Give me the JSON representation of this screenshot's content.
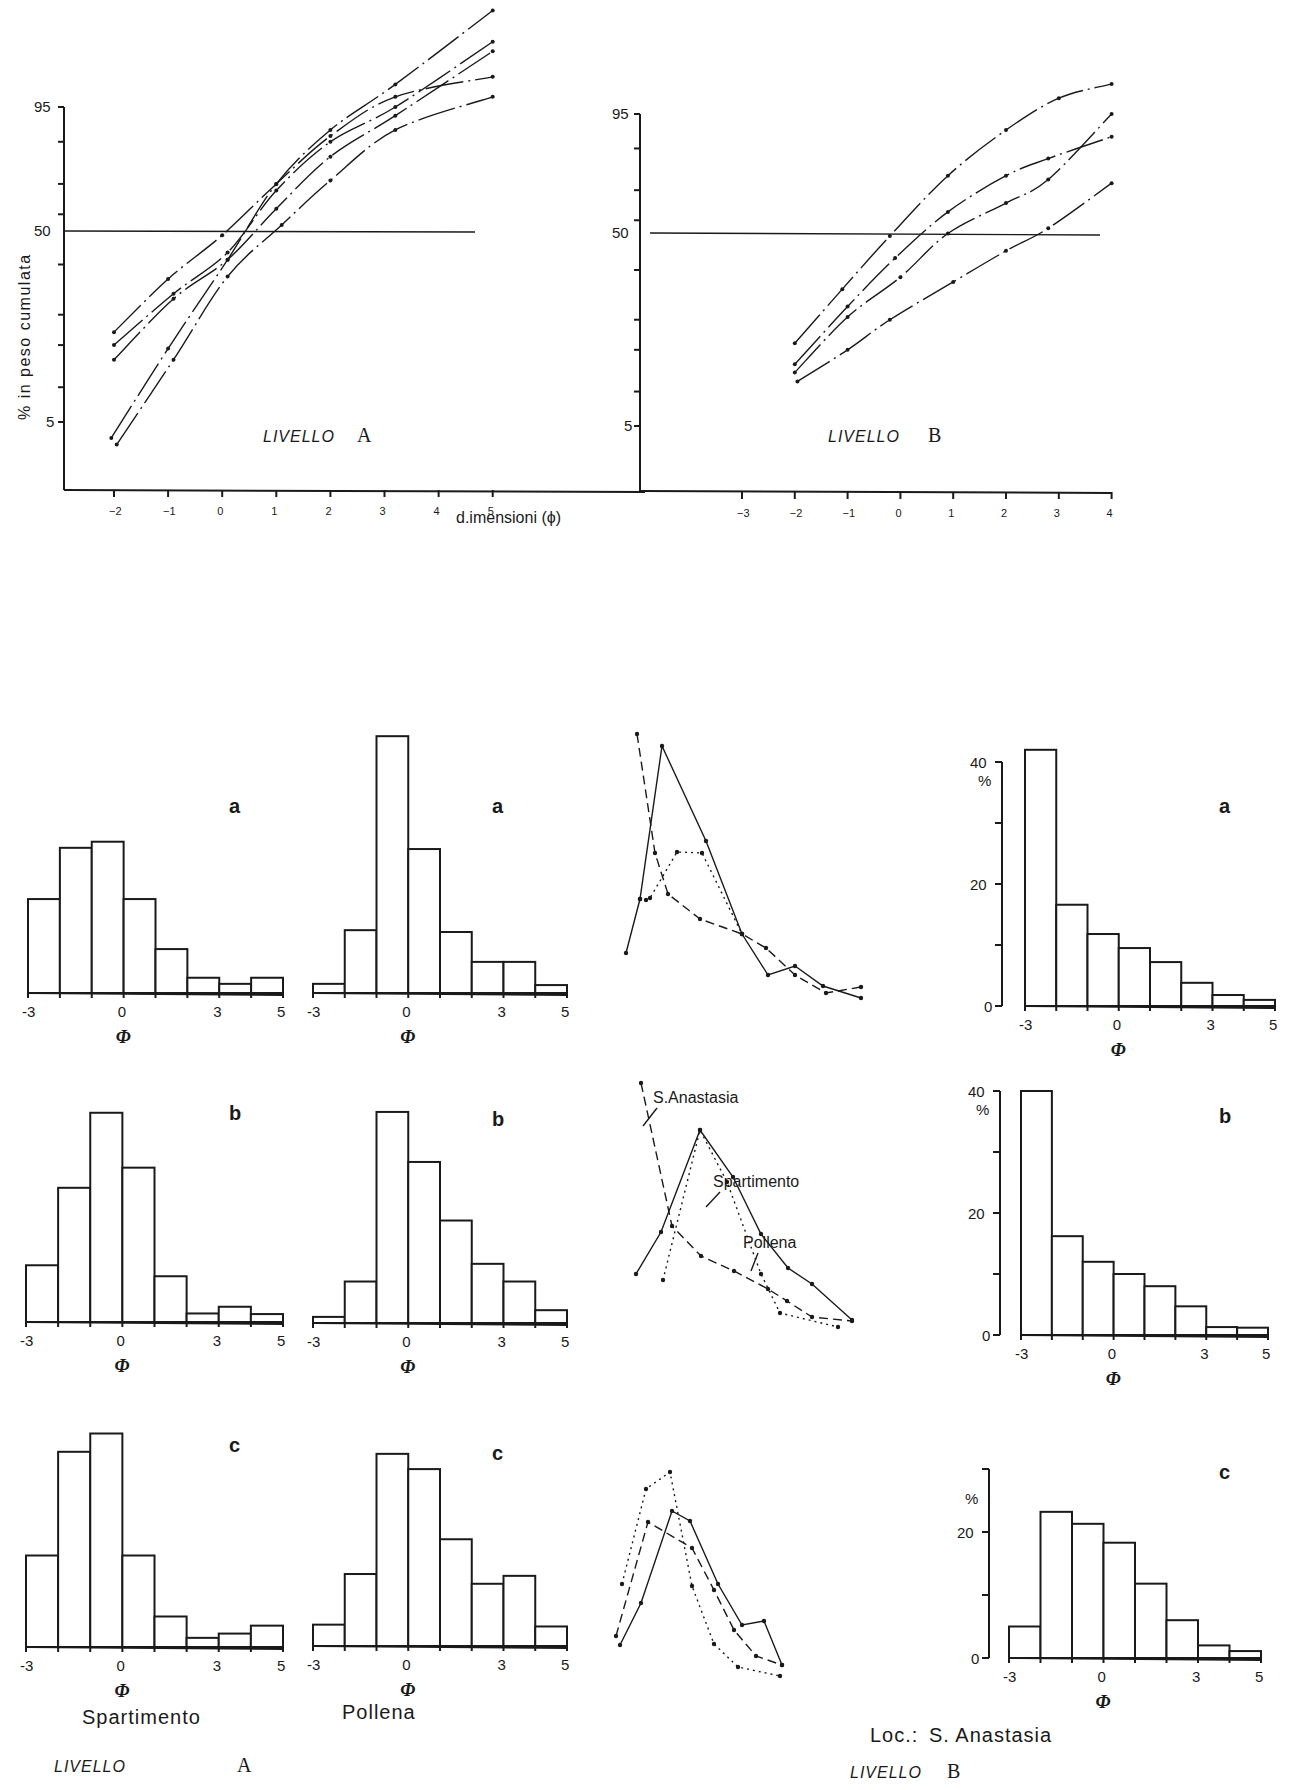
{
  "figure": {
    "y_axis_label": "% in peso cumulata",
    "x_axis_label": "d.imensioni (ϕ)",
    "phi_symbol": "Φ",
    "percent_symbol": "%",
    "livello_word": "LIVELLO",
    "level_a": "A",
    "level_b": "B",
    "location_prefix": "Loc.:",
    "location_name": "S. Anastasia",
    "col_labels": [
      "Spartimento",
      "Pollena"
    ],
    "annotations": [
      "S.Anastasia",
      "Spartimento",
      "Pollena"
    ],
    "panel_letters": [
      "a",
      "b",
      "c"
    ]
  },
  "chart_data": [
    {
      "id": "cumulative-livello-A",
      "type": "line",
      "title": "LIVELLO A",
      "xlabel": "dimensioni (ϕ)",
      "ylabel": "% in peso cumulata",
      "y_scale": "probability",
      "y_ticks": [
        5,
        50,
        95
      ],
      "x_ticks": [
        -2,
        -1,
        0,
        1,
        2,
        3,
        4,
        5
      ],
      "reference_line": 50,
      "series": [
        {
          "name": "curve 1",
          "x": [
            -2,
            -1,
            0,
            1,
            2,
            3.2,
            5
          ],
          "y": [
            24,
            44,
            62,
            80,
            91,
            96,
            97.5
          ]
        },
        {
          "name": "curve 2",
          "x": [
            -2,
            -0.9,
            0.1,
            1,
            2,
            3.2,
            5
          ],
          "y": [
            20,
            38,
            55,
            78,
            90,
            95,
            99
          ]
        },
        {
          "name": "curve 3",
          "x": [
            -2,
            -0.9,
            0.1,
            1,
            2,
            3.2,
            5
          ],
          "y": [
            16,
            36,
            52,
            72,
            87,
            94,
            98.7
          ]
        },
        {
          "name": "curve 4",
          "x": [
            -2.05,
            -1,
            0.1,
            1,
            2,
            3.2,
            5
          ],
          "y": [
            3.5,
            19,
            52,
            80,
            92,
            97,
            99.6
          ]
        },
        {
          "name": "curve 5",
          "x": [
            -1.95,
            -0.9,
            0.1,
            1.1,
            2,
            3.2,
            5
          ],
          "y": [
            3,
            16,
            45,
            66,
            81,
            92,
            96
          ]
        }
      ]
    },
    {
      "id": "cumulative-livello-B",
      "type": "line",
      "title": "LIVELLO B",
      "xlabel": "dimensioni (ϕ)",
      "ylabel": "% in peso cumulata",
      "y_scale": "probability",
      "y_ticks": [
        5,
        50,
        95
      ],
      "x_ticks": [
        -3,
        -2,
        -1,
        0,
        1,
        2,
        3,
        4
      ],
      "reference_line": 50,
      "series": [
        {
          "name": "curve 1",
          "x": [
            -2,
            -1.1,
            -0.2,
            0.9,
            2,
            3,
            4
          ],
          "y": [
            22,
            42,
            64,
            84,
            93,
            96.5,
            97.5
          ]
        },
        {
          "name": "curve 2",
          "x": [
            -2,
            -1,
            -0.1,
            0.9,
            2,
            2.8,
            4
          ],
          "y": [
            16,
            35,
            55,
            73,
            84,
            88,
            92
          ]
        },
        {
          "name": "curve 3",
          "x": [
            -2,
            -1,
            0,
            0.9,
            2,
            2.8,
            4
          ],
          "y": [
            14,
            31,
            47,
            65,
            76,
            83,
            95
          ]
        },
        {
          "name": "curve 4",
          "x": [
            -1.95,
            -1,
            -0.2,
            1,
            2,
            2.8,
            4
          ],
          "y": [
            12,
            20,
            30,
            45,
            58,
            67,
            82
          ]
        }
      ]
    },
    {
      "id": "hist-spartimento-a",
      "type": "bar",
      "title": "a",
      "xlabel": "Φ",
      "bins": [
        -3,
        -2,
        -1,
        0,
        1,
        2,
        3,
        4,
        5
      ],
      "x_tick_labels": [
        "-3",
        "0",
        "3",
        "5"
      ],
      "values": [
        15.4,
        23.8,
        24.8,
        15.4,
        7.2,
        2.5,
        1.5,
        2.5
      ]
    },
    {
      "id": "hist-pollena-a",
      "type": "bar",
      "title": "a",
      "xlabel": "Φ",
      "bins": [
        -3,
        -2,
        -1,
        0,
        1,
        2,
        3,
        4,
        5
      ],
      "x_tick_labels": [
        "-3",
        "0",
        "3",
        "5"
      ],
      "values": [
        1.5,
        10.3,
        42.1,
        23.6,
        10,
        5.1,
        5.1,
        1.3
      ]
    },
    {
      "id": "hist-spartimento-b",
      "type": "bar",
      "title": "b",
      "xlabel": "Φ",
      "bins": [
        -3,
        -2,
        -1,
        0,
        1,
        2,
        3,
        4,
        5
      ],
      "x_tick_labels": [
        "-3",
        "0",
        "3",
        "5"
      ],
      "values": [
        9.3,
        22,
        34.3,
        25.3,
        7.5,
        1.4,
        2.5,
        1.3
      ]
    },
    {
      "id": "hist-pollena-b",
      "type": "bar",
      "title": "b",
      "xlabel": "Φ",
      "bins": [
        -3,
        -2,
        -1,
        0,
        1,
        2,
        3,
        4,
        5
      ],
      "x_tick_labels": [
        "-3",
        "0",
        "3",
        "5"
      ],
      "values": [
        1,
        6.8,
        34.6,
        26.4,
        16.8,
        9.7,
        6.8,
        2.1
      ]
    },
    {
      "id": "hist-spartimento-c",
      "type": "bar",
      "title": "c",
      "xlabel": "Φ",
      "bins": [
        -3,
        -2,
        -1,
        0,
        1,
        2,
        3,
        4,
        5
      ],
      "x_tick_labels": [
        "-3",
        "0",
        "3",
        "5"
      ],
      "values": [
        15,
        32,
        35,
        15,
        5,
        1.5,
        2.2,
        3.5
      ]
    },
    {
      "id": "hist-pollena-c",
      "type": "bar",
      "title": "c",
      "xlabel": "Φ",
      "bins": [
        -3,
        -2,
        -1,
        0,
        1,
        2,
        3,
        4,
        5
      ],
      "x_tick_labels": [
        "-3",
        "0",
        "3",
        "5"
      ],
      "values": [
        3.5,
        11.8,
        31.5,
        29,
        17.5,
        10.2,
        11.5,
        3.2
      ]
    },
    {
      "id": "hist-s-anastasia-a",
      "type": "bar",
      "title": "a",
      "xlabel": "Φ",
      "ylabel": "%",
      "bins": [
        -3,
        -2,
        -1,
        0,
        1,
        2,
        3,
        4,
        5
      ],
      "x_tick_labels": [
        "-3",
        "0",
        "3",
        "5"
      ],
      "y_ticks": [
        0,
        20,
        40
      ],
      "ylim": [
        0,
        40
      ],
      "values": [
        42,
        16.6,
        11.8,
        9.5,
        7.2,
        3.8,
        1.8,
        1
      ]
    },
    {
      "id": "hist-s-anastasia-b",
      "type": "bar",
      "title": "b",
      "xlabel": "Φ",
      "ylabel": "%",
      "bins": [
        -3,
        -2,
        -1,
        0,
        1,
        2,
        3,
        4,
        5
      ],
      "x_tick_labels": [
        "-3",
        "0",
        "3",
        "5"
      ],
      "y_ticks": [
        0,
        20,
        40
      ],
      "ylim": [
        0,
        40
      ],
      "values": [
        40,
        16.2,
        12,
        10,
        8,
        4.7,
        1.3,
        1.2
      ]
    },
    {
      "id": "hist-s-anastasia-c",
      "type": "bar",
      "title": "c",
      "xlabel": "Φ",
      "ylabel": "%",
      "bins": [
        -3,
        -2,
        -1,
        0,
        1,
        2,
        3,
        4,
        5
      ],
      "x_tick_labels": [
        "-3",
        "0",
        "3",
        "5"
      ],
      "y_ticks": [
        0,
        20
      ],
      "ylim": [
        0,
        30
      ],
      "values": [
        5,
        23.2,
        21.3,
        18.3,
        11.8,
        6,
        2,
        1.1
      ]
    },
    {
      "id": "frequency-curves-a",
      "type": "line",
      "title": "a",
      "legend": [
        "Spartimento (solid)",
        "S.Anastasia (dashed)",
        "Pollena (dotted)"
      ],
      "series": [
        {
          "name": "Spartimento",
          "style": "solid",
          "px": [
            [
              626,
              953
            ],
            [
              640,
              899
            ],
            [
              662,
              746
            ],
            [
              706,
              841
            ],
            [
              742,
              934
            ],
            [
              768,
              975
            ],
            [
              795,
              966
            ],
            [
              823,
              986
            ],
            [
              861,
              998
            ]
          ]
        },
        {
          "name": "S.Anastasia",
          "style": "dashed",
          "px": [
            [
              637,
              734
            ],
            [
              655,
              853
            ],
            [
              668,
              894
            ],
            [
              700,
              919
            ],
            [
              742,
              934
            ],
            [
              766,
              948
            ],
            [
              795,
              975
            ],
            [
              826,
              993
            ],
            [
              861,
              987
            ]
          ]
        },
        {
          "name": "Pollena",
          "style": "dotted",
          "px": [
            [
              640,
              899
            ],
            [
              646,
              900
            ],
            [
              650,
              898
            ],
            [
              677,
              852
            ],
            [
              702,
              853
            ],
            [
              742,
              934
            ]
          ]
        }
      ]
    },
    {
      "id": "frequency-curves-b",
      "type": "line",
      "title": "b",
      "series": [
        {
          "name": "Spartimento",
          "style": "solid",
          "px": [
            [
              636,
              1274
            ],
            [
              661,
              1232
            ],
            [
              700,
              1130
            ],
            [
              733,
              1177
            ],
            [
              761,
              1234
            ],
            [
              788,
              1268
            ],
            [
              812,
              1284
            ],
            [
              852,
              1320
            ]
          ]
        },
        {
          "name": "S.Anastasia",
          "style": "dashed",
          "px": [
            [
              641,
              1083
            ],
            [
              672,
              1226
            ],
            [
              701,
              1256
            ],
            [
              734,
              1271
            ],
            [
              768,
              1289
            ],
            [
              787,
              1301
            ],
            [
              812,
              1317
            ],
            [
              852,
              1321
            ]
          ]
        },
        {
          "name": "Pollena",
          "style": "dotted",
          "px": [
            [
              663,
              1280
            ],
            [
              700,
              1130
            ],
            [
              727,
              1182
            ],
            [
              761,
              1274
            ],
            [
              780,
              1313
            ],
            [
              838,
              1327
            ]
          ]
        }
      ]
    },
    {
      "id": "frequency-curves-c",
      "type": "line",
      "title": "c",
      "series": [
        {
          "name": "Spartimento",
          "style": "solid",
          "px": [
            [
              620,
              1645
            ],
            [
              641,
              1603
            ],
            [
              672,
              1511
            ],
            [
              690,
              1521
            ],
            [
              718,
              1584
            ],
            [
              742,
              1625
            ],
            [
              764,
              1621
            ],
            [
              782,
              1665
            ]
          ]
        },
        {
          "name": "S.Anastasia",
          "style": "dashed",
          "px": [
            [
              616,
              1636
            ],
            [
              648,
              1522
            ],
            [
              692,
              1548
            ],
            [
              714,
              1590
            ],
            [
              734,
              1630
            ],
            [
              756,
              1656
            ],
            [
              782,
              1665
            ]
          ]
        },
        {
          "name": "Pollena",
          "style": "dotted",
          "px": [
            [
              622,
              1584
            ],
            [
              646,
              1489
            ],
            [
              670,
              1472
            ],
            [
              692,
              1586
            ],
            [
              714,
              1644
            ],
            [
              738,
              1667
            ],
            [
              780,
              1676
            ]
          ]
        }
      ]
    }
  ]
}
